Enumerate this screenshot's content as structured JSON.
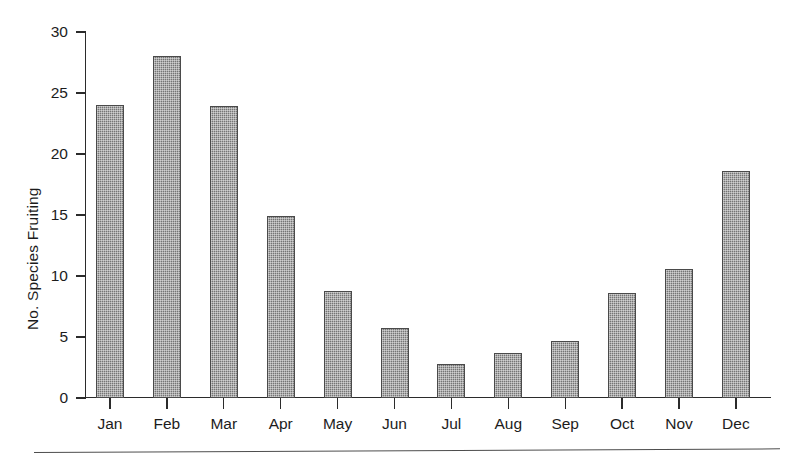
{
  "chart_data": {
    "type": "bar",
    "title": "",
    "subtitle": "",
    "xlabel": "",
    "ylabel": "No. Species Fruiting",
    "categories": [
      "Jan",
      "Feb",
      "Mar",
      "Apr",
      "May",
      "Jun",
      "Jul",
      "Aug",
      "Sep",
      "Oct",
      "Nov",
      "Dec"
    ],
    "values": [
      24.0,
      28.0,
      23.9,
      14.9,
      8.8,
      5.7,
      2.8,
      3.7,
      4.7,
      8.6,
      10.6,
      18.6
    ],
    "ylim": [
      0,
      30
    ],
    "y_ticks": [
      0,
      5,
      10,
      15,
      20,
      25,
      30
    ],
    "y_tick_labels": [
      "0",
      "5",
      "10",
      "15",
      "20",
      "25",
      "30"
    ],
    "x_tick_labels": [
      "Jan",
      "Feb",
      "Mar",
      "Apr",
      "May",
      "Jun",
      "Jul",
      "Aug",
      "Sep",
      "Oct",
      "Nov",
      "Dec"
    ],
    "grid": false,
    "legend": null,
    "legend_position": "none",
    "bar_color": "#828282",
    "bar_edge_color": "#4a4a4a",
    "axis_color": "#2b2b2b",
    "background_color": "#ffffff"
  },
  "figure": {
    "y_axis_title": "No. Species Fruiting",
    "bottom_rule": ""
  }
}
